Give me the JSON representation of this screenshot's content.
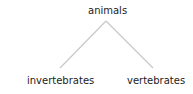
{
  "tree": {
    "root": {
      "label": "animals"
    },
    "children": [
      {
        "label": "invertebrates"
      },
      {
        "label": "vertebrates"
      }
    ]
  },
  "colors": {
    "line": "#c8c8c8",
    "text": "#222222"
  }
}
